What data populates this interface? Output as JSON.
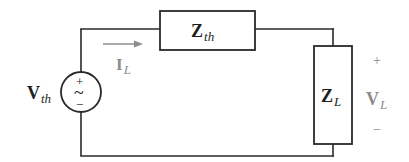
{
  "diagram": {
    "type": "circuit",
    "colors": {
      "wire": "#2a2a2a",
      "label_dark": "#1e1e1e",
      "label_gray": "#8c8c8c",
      "background": "#ffffff"
    },
    "source": {
      "symbol": "ac-voltage-source",
      "label_main": "V",
      "label_sub": "th",
      "plus": "+",
      "tilde": "~",
      "minus": "−"
    },
    "thevenin_impedance": {
      "label_main": "Z",
      "label_sub": "th"
    },
    "load_impedance": {
      "label_main": "Z",
      "label_sub": "L"
    },
    "load_current": {
      "label_main": "I",
      "label_sub": "L",
      "direction": "right"
    },
    "load_voltage": {
      "plus": "+",
      "label_main": "V",
      "label_sub": "L",
      "minus": "−"
    }
  }
}
